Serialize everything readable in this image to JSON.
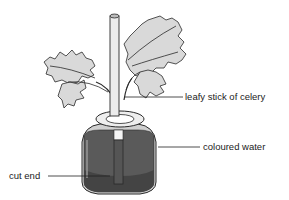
{
  "diagram": {
    "labels": {
      "celery": "leafy stick of celery",
      "water": "coloured water",
      "cut_end": "cut end"
    },
    "colors": {
      "water": "#5a5a5a",
      "water_dark": "#3f3f3f",
      "leaf": "#d8d8d8",
      "outline": "#2a2a2a",
      "stem": "#ececec"
    }
  }
}
